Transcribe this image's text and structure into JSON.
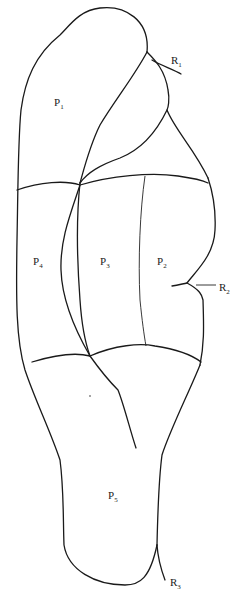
{
  "figure": {
    "type": "anatomical-outline-diagram",
    "stroke_color": "#1a1a1a",
    "background": "#ffffff"
  },
  "regions": [
    {
      "id": "P1",
      "base": "P",
      "sub": "1",
      "x": 54,
      "y": 106
    },
    {
      "id": "P2",
      "base": "P",
      "sub": "2",
      "x": 157,
      "y": 265
    },
    {
      "id": "P3",
      "base": "P",
      "sub": "3",
      "x": 100,
      "y": 265
    },
    {
      "id": "P4",
      "base": "P",
      "sub": "4",
      "x": 33,
      "y": 265
    },
    {
      "id": "P5",
      "base": "P",
      "sub": "5",
      "x": 108,
      "y": 499
    }
  ],
  "markers": [
    {
      "id": "R1",
      "base": "R",
      "sub": "1",
      "x": 171,
      "y": 64
    },
    {
      "id": "R2",
      "base": "R",
      "sub": "2",
      "x": 219,
      "y": 291
    },
    {
      "id": "R3",
      "base": "R",
      "sub": "3",
      "x": 170,
      "y": 586
    }
  ]
}
